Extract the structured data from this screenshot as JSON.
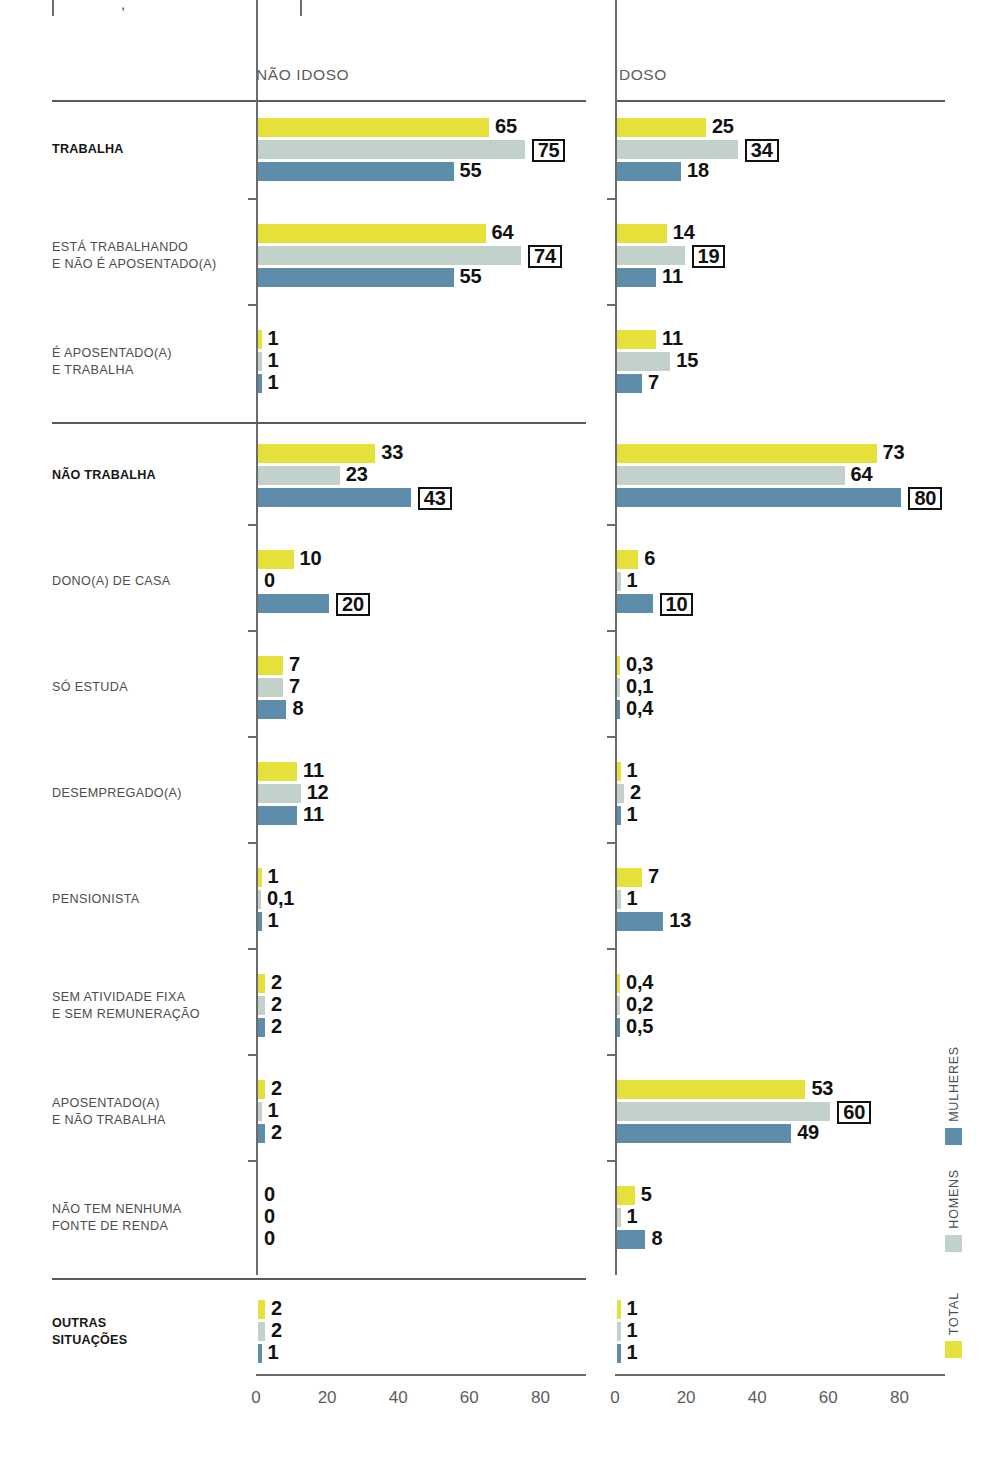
{
  "chart_data": {
    "type": "bar",
    "orientation": "horizontal",
    "title": "",
    "xlabel": "",
    "ylabel": "",
    "xlim": [
      0,
      93
    ],
    "xticks": [
      0,
      20,
      40,
      60,
      80
    ],
    "grid": false,
    "legend_position": "right-rotated",
    "panels": [
      {
        "key": "nao_idoso",
        "label": "NÃO IDOSO"
      },
      {
        "key": "idoso",
        "label": "IDOSO"
      }
    ],
    "series": [
      {
        "name": "TOTAL",
        "color": "#e6e03b"
      },
      {
        "name": "HOMENS",
        "color": "#c2d2cb"
      },
      {
        "name": "MULHERES",
        "color": "#5e8cab"
      }
    ],
    "sections": [
      {
        "rule_above": false,
        "categories": [
          {
            "label_lines": [
              "TRABALHA"
            ],
            "bold": true,
            "nao_idoso": [
              {
                "series": "TOTAL",
                "value": 65,
                "label": "65",
                "boxed": false
              },
              {
                "series": "HOMENS",
                "value": 75,
                "label": "75",
                "boxed": true
              },
              {
                "series": "MULHERES",
                "value": 55,
                "label": "55",
                "boxed": false
              }
            ],
            "idoso": [
              {
                "series": "TOTAL",
                "value": 25,
                "label": "25",
                "boxed": false
              },
              {
                "series": "HOMENS",
                "value": 34,
                "label": "34",
                "boxed": true
              },
              {
                "series": "MULHERES",
                "value": 18,
                "label": "18",
                "boxed": false
              }
            ]
          },
          {
            "label_lines": [
              "ESTÁ TRABALHANDO",
              "E NÃO É APOSENTADO(A)"
            ],
            "bold": false,
            "nao_idoso": [
              {
                "series": "TOTAL",
                "value": 64,
                "label": "64",
                "boxed": false
              },
              {
                "series": "HOMENS",
                "value": 74,
                "label": "74",
                "boxed": true
              },
              {
                "series": "MULHERES",
                "value": 55,
                "label": "55",
                "boxed": false
              }
            ],
            "idoso": [
              {
                "series": "TOTAL",
                "value": 14,
                "label": "14",
                "boxed": false
              },
              {
                "series": "HOMENS",
                "value": 19,
                "label": "19",
                "boxed": true
              },
              {
                "series": "MULHERES",
                "value": 11,
                "label": "11",
                "boxed": false
              }
            ]
          },
          {
            "label_lines": [
              "É APOSENTADO(A)",
              "E TRABALHA"
            ],
            "bold": false,
            "nao_idoso": [
              {
                "series": "TOTAL",
                "value": 1,
                "label": "1",
                "boxed": false
              },
              {
                "series": "HOMENS",
                "value": 1,
                "label": "1",
                "boxed": false
              },
              {
                "series": "MULHERES",
                "value": 1,
                "label": "1",
                "boxed": false
              }
            ],
            "idoso": [
              {
                "series": "TOTAL",
                "value": 11,
                "label": "11",
                "boxed": false
              },
              {
                "series": "HOMENS",
                "value": 15,
                "label": "15",
                "boxed": false
              },
              {
                "series": "MULHERES",
                "value": 7,
                "label": "7",
                "boxed": false
              }
            ]
          }
        ]
      },
      {
        "rule_above": true,
        "categories": [
          {
            "label_lines": [
              "NÃO TRABALHA"
            ],
            "bold": true,
            "nao_idoso": [
              {
                "series": "TOTAL",
                "value": 33,
                "label": "33",
                "boxed": false
              },
              {
                "series": "HOMENS",
                "value": 23,
                "label": "23",
                "boxed": false
              },
              {
                "series": "MULHERES",
                "value": 43,
                "label": "43",
                "boxed": true
              }
            ],
            "idoso": [
              {
                "series": "TOTAL",
                "value": 73,
                "label": "73",
                "boxed": false
              },
              {
                "series": "HOMENS",
                "value": 64,
                "label": "64",
                "boxed": false
              },
              {
                "series": "MULHERES",
                "value": 80,
                "label": "80",
                "boxed": true
              }
            ]
          },
          {
            "label_lines": [
              "DONO(A) DE CASA"
            ],
            "bold": false,
            "nao_idoso": [
              {
                "series": "TOTAL",
                "value": 10,
                "label": "10",
                "boxed": false
              },
              {
                "series": "HOMENS",
                "value": 0,
                "label": "0",
                "boxed": false
              },
              {
                "series": "MULHERES",
                "value": 20,
                "label": "20",
                "boxed": true
              }
            ],
            "idoso": [
              {
                "series": "TOTAL",
                "value": 6,
                "label": "6",
                "boxed": false
              },
              {
                "series": "HOMENS",
                "value": 1,
                "label": "1",
                "boxed": false
              },
              {
                "series": "MULHERES",
                "value": 10,
                "label": "10",
                "boxed": true
              }
            ]
          },
          {
            "label_lines": [
              "SÓ ESTUDA"
            ],
            "bold": false,
            "nao_idoso": [
              {
                "series": "TOTAL",
                "value": 7,
                "label": "7",
                "boxed": false
              },
              {
                "series": "HOMENS",
                "value": 7,
                "label": "7",
                "boxed": false
              },
              {
                "series": "MULHERES",
                "value": 8,
                "label": "8",
                "boxed": false
              }
            ],
            "idoso": [
              {
                "series": "TOTAL",
                "value": 0.3,
                "label": "0,3",
                "boxed": false
              },
              {
                "series": "HOMENS",
                "value": 0.1,
                "label": "0,1",
                "boxed": false
              },
              {
                "series": "MULHERES",
                "value": 0.4,
                "label": "0,4",
                "boxed": false
              }
            ]
          },
          {
            "label_lines": [
              "DESEMPREGADO(A)"
            ],
            "bold": false,
            "nao_idoso": [
              {
                "series": "TOTAL",
                "value": 11,
                "label": "11",
                "boxed": false
              },
              {
                "series": "HOMENS",
                "value": 12,
                "label": "12",
                "boxed": false
              },
              {
                "series": "MULHERES",
                "value": 11,
                "label": "11",
                "boxed": false
              }
            ],
            "idoso": [
              {
                "series": "TOTAL",
                "value": 1,
                "label": "1",
                "boxed": false
              },
              {
                "series": "HOMENS",
                "value": 2,
                "label": "2",
                "boxed": false
              },
              {
                "series": "MULHERES",
                "value": 1,
                "label": "1",
                "boxed": false
              }
            ]
          },
          {
            "label_lines": [
              "PENSIONISTA"
            ],
            "bold": false,
            "nao_idoso": [
              {
                "series": "TOTAL",
                "value": 1,
                "label": "1",
                "boxed": false
              },
              {
                "series": "HOMENS",
                "value": 0.1,
                "label": "0,1",
                "boxed": false
              },
              {
                "series": "MULHERES",
                "value": 1,
                "label": "1",
                "boxed": false
              }
            ],
            "idoso": [
              {
                "series": "TOTAL",
                "value": 7,
                "label": "7",
                "boxed": false
              },
              {
                "series": "HOMENS",
                "value": 1,
                "label": "1",
                "boxed": false
              },
              {
                "series": "MULHERES",
                "value": 13,
                "label": "13",
                "boxed": false
              }
            ]
          },
          {
            "label_lines": [
              "SEM ATIVIDADE FIXA",
              "E SEM REMUNERAÇÃO"
            ],
            "bold": false,
            "nao_idoso": [
              {
                "series": "TOTAL",
                "value": 2,
                "label": "2",
                "boxed": false
              },
              {
                "series": "HOMENS",
                "value": 2,
                "label": "2",
                "boxed": false
              },
              {
                "series": "MULHERES",
                "value": 2,
                "label": "2",
                "boxed": false
              }
            ],
            "idoso": [
              {
                "series": "TOTAL",
                "value": 0.4,
                "label": "0,4",
                "boxed": false
              },
              {
                "series": "HOMENS",
                "value": 0.2,
                "label": "0,2",
                "boxed": false
              },
              {
                "series": "MULHERES",
                "value": 0.5,
                "label": "0,5",
                "boxed": false
              }
            ]
          },
          {
            "label_lines": [
              "APOSENTADO(A)",
              "E NÃO TRABALHA"
            ],
            "bold": false,
            "nao_idoso": [
              {
                "series": "TOTAL",
                "value": 2,
                "label": "2",
                "boxed": false
              },
              {
                "series": "HOMENS",
                "value": 1,
                "label": "1",
                "boxed": false
              },
              {
                "series": "MULHERES",
                "value": 2,
                "label": "2",
                "boxed": false
              }
            ],
            "idoso": [
              {
                "series": "TOTAL",
                "value": 53,
                "label": "53",
                "boxed": false
              },
              {
                "series": "HOMENS",
                "value": 60,
                "label": "60",
                "boxed": true
              },
              {
                "series": "MULHERES",
                "value": 49,
                "label": "49",
                "boxed": false
              }
            ]
          },
          {
            "label_lines": [
              "NÃO TEM NENHUMA",
              "FONTE DE RENDA"
            ],
            "bold": false,
            "nao_idoso": [
              {
                "series": "TOTAL",
                "value": 0,
                "label": "0",
                "boxed": false
              },
              {
                "series": "HOMENS",
                "value": 0,
                "label": "0",
                "boxed": false
              },
              {
                "series": "MULHERES",
                "value": 0,
                "label": "0",
                "boxed": false
              }
            ],
            "idoso": [
              {
                "series": "TOTAL",
                "value": 5,
                "label": "5",
                "boxed": false
              },
              {
                "series": "HOMENS",
                "value": 1,
                "label": "1",
                "boxed": false
              },
              {
                "series": "MULHERES",
                "value": 8,
                "label": "8",
                "boxed": false
              }
            ]
          }
        ]
      },
      {
        "rule_above": true,
        "categories": [
          {
            "label_lines": [
              "OUTRAS",
              "SITUAÇÕES"
            ],
            "bold": true,
            "nao_idoso": [
              {
                "series": "TOTAL",
                "value": 2,
                "label": "2",
                "boxed": false
              },
              {
                "series": "HOMENS",
                "value": 2,
                "label": "2",
                "boxed": false
              },
              {
                "series": "MULHERES",
                "value": 1,
                "label": "1",
                "boxed": false
              }
            ],
            "idoso": [
              {
                "series": "TOTAL",
                "value": 1,
                "label": "1",
                "boxed": false
              },
              {
                "series": "HOMENS",
                "value": 1,
                "label": "1",
                "boxed": false
              },
              {
                "series": "MULHERES",
                "value": 1,
                "label": "1",
                "boxed": false
              }
            ]
          }
        ]
      }
    ]
  },
  "legend": {
    "items": [
      {
        "name": "MULHERES",
        "color": "#5e8cab"
      },
      {
        "name": "HOMENS",
        "color": "#c2d2cb"
      },
      {
        "name": "TOTAL",
        "color": "#e6e03b"
      }
    ]
  },
  "top_fragment": {
    "comma": ","
  }
}
